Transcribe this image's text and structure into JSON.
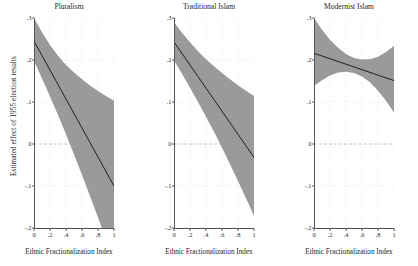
{
  "chart_data": {
    "type": "line",
    "title": "",
    "ylabel": "Estimated effect of 1955 election results",
    "xlabel": "Ethnic Fractionalization Index",
    "xlim": [
      0,
      1
    ],
    "ylim": [
      -0.2,
      0.3
    ],
    "xticks": [
      "0",
      ".2",
      ".4",
      ".6",
      ".8",
      "1"
    ],
    "xtick_values": [
      0,
      0.2,
      0.4,
      0.6,
      0.8,
      1
    ],
    "yticks": [
      ".3",
      ".2",
      ".1",
      "0",
      "-.1",
      "-.2"
    ],
    "ytick_values": [
      0.3,
      0.2,
      0.1,
      0,
      -0.1,
      -0.2
    ],
    "grid": true,
    "legend": "none",
    "band_label": "95% confidence interval",
    "zero_reference_line": 0,
    "panels": [
      {
        "title": "Pluralism",
        "x": [
          0,
          0.1,
          0.2,
          0.3,
          0.4,
          0.5,
          0.6,
          0.7,
          0.8,
          0.9,
          1.0
        ],
        "fit": [
          0.245,
          0.2105,
          0.176,
          0.1415,
          0.107,
          0.0725,
          0.038,
          0.0035,
          -0.031,
          -0.0655,
          -0.1
        ],
        "lower": [
          0.198,
          0.156,
          0.113,
          0.069,
          0.023,
          -0.025,
          -0.074,
          -0.124,
          -0.175,
          -0.227,
          -0.279
        ],
        "upper": [
          0.3,
          0.266,
          0.236,
          0.21,
          0.188,
          0.17,
          0.154,
          0.139,
          0.126,
          0.114,
          0.103
        ]
      },
      {
        "title": "Traditional Islam",
        "x": [
          0,
          0.1,
          0.2,
          0.3,
          0.4,
          0.5,
          0.6,
          0.7,
          0.8,
          0.9,
          1.0
        ],
        "fit": [
          0.243,
          0.2155,
          0.188,
          0.1605,
          0.133,
          0.1055,
          0.078,
          0.0505,
          0.023,
          -0.0045,
          -0.032
        ],
        "lower": [
          0.199,
          0.167,
          0.134,
          0.1,
          0.065,
          0.029,
          -0.009,
          -0.048,
          -0.088,
          -0.129,
          -0.171
        ],
        "upper": [
          0.29,
          0.265,
          0.242,
          0.221,
          0.202,
          0.185,
          0.169,
          0.154,
          0.14,
          0.127,
          0.114
        ]
      },
      {
        "title": "Modernist Islam",
        "x": [
          0,
          0.1,
          0.2,
          0.3,
          0.4,
          0.5,
          0.6,
          0.7,
          0.8,
          0.9,
          1.0
        ],
        "fit": [
          0.216,
          0.2095,
          0.203,
          0.1965,
          0.19,
          0.1835,
          0.177,
          0.1705,
          0.164,
          0.1575,
          0.151
        ],
        "lower": [
          0.138,
          0.152,
          0.163,
          0.17,
          0.172,
          0.169,
          0.161,
          0.147,
          0.127,
          0.103,
          0.075
        ],
        "upper": [
          0.3,
          0.272,
          0.248,
          0.229,
          0.214,
          0.205,
          0.201,
          0.202,
          0.208,
          0.219,
          0.234
        ]
      }
    ],
    "colors": {
      "band": "#9a9a9a",
      "line": "#111111",
      "grid": "#d8d8d8",
      "axis": "#555555",
      "zero_line": "#bdbdbd"
    }
  }
}
